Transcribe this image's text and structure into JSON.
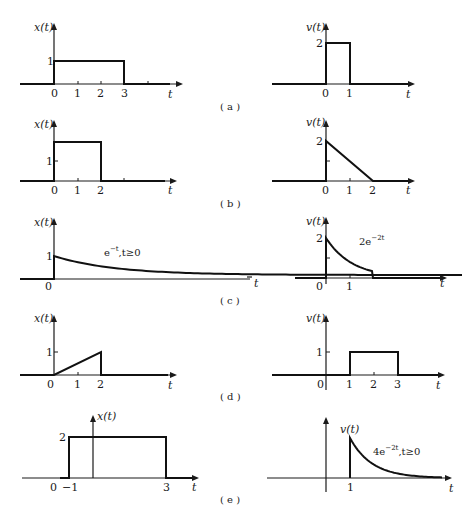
{
  "figure": {
    "rows": [
      {
        "caption": "( a )",
        "left": {
          "ylabel": "x(t)",
          "xlabel": "t",
          "xticks": [
            "0",
            "1",
            "2",
            "3"
          ],
          "yticks": [
            "1"
          ],
          "signal": {
            "type": "rect",
            "t_start": 0,
            "t_end": 3,
            "amplitude": 1
          }
        },
        "right": {
          "ylabel": "v(t)",
          "xlabel": "t",
          "xticks": [
            "0",
            "1"
          ],
          "yticks": [
            "2"
          ],
          "signal": {
            "type": "rect",
            "t_start": 0,
            "t_end": 1,
            "amplitude": 2
          }
        }
      },
      {
        "caption": "( b )",
        "left": {
          "ylabel": "x(t)",
          "xlabel": "t",
          "xticks": [
            "0",
            "1",
            "2"
          ],
          "yticks": [
            "1"
          ],
          "signal": {
            "type": "rect",
            "t_start": 0,
            "t_end": 2,
            "amplitude": 2
          }
        },
        "right": {
          "ylabel": "v(t)",
          "xlabel": "t",
          "xticks": [
            "0",
            "1",
            "2"
          ],
          "yticks": [
            "2"
          ],
          "signal": {
            "type": "ramp-down",
            "t_start": 0,
            "t_end": 2,
            "amplitude": 2
          }
        }
      },
      {
        "caption": "( c )",
        "left": {
          "ylabel": "x(t)",
          "xlabel": "t",
          "xticks": [
            "0"
          ],
          "yticks": [
            "1"
          ],
          "annotation": {
            "base": "e",
            "exponent": "−t",
            "suffix": ",t≥0"
          },
          "signal": {
            "type": "exp",
            "t_start": 0,
            "amplitude": 1,
            "rate": 1
          }
        },
        "right": {
          "ylabel": "v(t)",
          "xlabel": "t",
          "xticks": [
            "0",
            "1"
          ],
          "yticks": [
            "2"
          ],
          "annotation": {
            "base": "2e",
            "exponent": "−2t",
            "suffix": ""
          },
          "signal": {
            "type": "exp-truncated",
            "t_start": 0,
            "t_end": 2,
            "amplitude": 2,
            "rate": 2
          }
        }
      },
      {
        "caption": "( d )",
        "left": {
          "ylabel": "x(t)",
          "xlabel": "t",
          "xticks": [
            "0",
            "1",
            "2"
          ],
          "yticks": [
            "1"
          ],
          "signal": {
            "type": "ramp-up",
            "t_start": 0,
            "t_end": 2,
            "amplitude": 1
          }
        },
        "right": {
          "ylabel": "v(t)",
          "xlabel": "t",
          "xticks": [
            "0",
            "1",
            "2",
            "3"
          ],
          "yticks": [
            "1"
          ],
          "signal": {
            "type": "rect",
            "t_start": 1,
            "t_end": 3,
            "amplitude": 1
          }
        }
      },
      {
        "caption": "( e )",
        "left": {
          "ylabel": "x(t)",
          "xlabel": "t",
          "xticks": [
            "0",
            "−1",
            "3"
          ],
          "yticks": [
            "2"
          ],
          "signal": {
            "type": "rect",
            "t_start": -1,
            "t_end": 3,
            "amplitude": 2
          }
        },
        "right": {
          "ylabel": "v(t)",
          "xlabel": "t",
          "xticks": [
            "1"
          ],
          "yticks": [],
          "annotation": {
            "base": "4e",
            "exponent": "−2t",
            "suffix": ",t≥0"
          },
          "signal": {
            "type": "exp",
            "t_start": 1,
            "amplitude": 4,
            "rate": 2
          }
        }
      }
    ]
  }
}
